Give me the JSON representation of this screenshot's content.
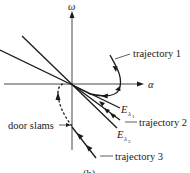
{
  "diagram": {
    "axes": {
      "vertical_label": "ω",
      "horizontal_label": "α"
    },
    "eigenvectors": [
      {
        "label_main": "E",
        "label_sub": "λ",
        "label_subsub": "1"
      },
      {
        "label_main": "E",
        "label_sub": "λ",
        "label_subsub": "2"
      }
    ],
    "trajectories": [
      {
        "label": "trajectory 1"
      },
      {
        "label": "trajectory 2"
      },
      {
        "label": "trajectory 3"
      }
    ],
    "annotations": {
      "door_slams": "door slams"
    },
    "caption": "(b)",
    "colors": {
      "ink": "#1a1a1a",
      "background": "#ffffff"
    }
  }
}
